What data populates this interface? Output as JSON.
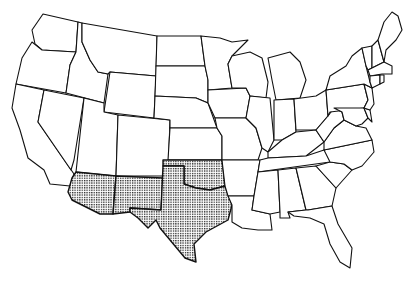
{
  "map": {
    "type": "outline map",
    "region": "Contiguous United States",
    "style": {
      "outline_color": "#111111",
      "fill_color": "#ffffff",
      "shade_pattern": "dot-grid stipple",
      "shade_color": "#222222"
    },
    "highlighted_states": [
      "Arizona",
      "New Mexico",
      "Texas",
      "Oklahoma"
    ],
    "states": [
      {
        "id": "WA",
        "name": "Washington",
        "shaded": false,
        "d": "M43,14 L78,22 L76,52 L42,50 L35,44 L32,30 Z"
      },
      {
        "id": "OR",
        "name": "Oregon",
        "shaded": false,
        "d": "M32,42 L42,50 L76,52 L70,65 L66,93 L16,84 L22,58 Z"
      },
      {
        "id": "CA",
        "name": "California",
        "shaded": false,
        "d": "M16,84 L44,90 L38,122 L74,174 L70,186 L50,184 L44,170 L28,158 L20,130 L12,108 Z"
      },
      {
        "id": "ID",
        "name": "Idaho",
        "shaded": false,
        "d": "M78,22 L82,23 L82,42 L90,60 L98,72 L108,74 L104,103 L66,93 L70,65 L76,52 Z"
      },
      {
        "id": "NV",
        "name": "Nevada",
        "shaded": false,
        "d": "M44,90 L84,98 L74,160 L71,170 L38,122 Z"
      },
      {
        "id": "MT",
        "name": "Montana",
        "shaded": false,
        "d": "M82,23 L157,36 L156,76 L110,72 L108,74 L98,72 L90,60 L82,42 Z"
      },
      {
        "id": "WY",
        "name": "Wyoming",
        "shaded": false,
        "d": "M110,72 L156,76 L154,118 L104,112 Z"
      },
      {
        "id": "UT",
        "name": "Utah",
        "shaded": false,
        "d": "M84,98 L104,103 L104,112 L118,115 L116,176 L76,172 Z"
      },
      {
        "id": "CO",
        "name": "Colorado",
        "shaded": false,
        "d": "M118,115 L170,120 L168,176 L116,176 Z"
      },
      {
        "id": "AZ",
        "name": "Arizona",
        "shaded": true,
        "d": "M76,172 L116,176 L113,214 L100,214 L72,200 L68,192 L72,178 Z"
      },
      {
        "id": "NM",
        "name": "New Mexico",
        "shaded": true,
        "d": "M116,176 L163,178 L161,210 L130,208 L130,212 L113,214 Z"
      },
      {
        "id": "ND",
        "name": "North Dakota",
        "shaded": false,
        "d": "M157,36 L201,36 L205,66 L156,66 Z"
      },
      {
        "id": "SD",
        "name": "South Dakota",
        "shaded": false,
        "d": "M156,66 L205,66 L208,80 L208,103 L196,98 L155,96 Z"
      },
      {
        "id": "NE",
        "name": "Nebraska",
        "shaded": false,
        "d": "M155,96 L196,98 L208,103 L217,128 L170,128 L170,120 L154,118 Z"
      },
      {
        "id": "KS",
        "name": "Kansas",
        "shaded": false,
        "d": "M170,128 L217,128 L222,136 L222,160 L168,160 Z"
      },
      {
        "id": "OK",
        "name": "Oklahoma",
        "shaded": true,
        "d": "M163,160 L222,160 L225,186 L210,190 L196,188 L184,184 L184,166 L163,166 Z"
      },
      {
        "id": "TX",
        "name": "Texas",
        "shaded": true,
        "d": "M163,166 L184,166 L184,184 L196,188 L210,190 L225,186 L232,205 L228,220 L206,232 L194,244 L196,262 L185,258 L170,240 L160,228 L156,220 L148,228 L138,218 L130,212 L130,208 L161,210 Z"
      },
      {
        "id": "MN",
        "name": "Minnesota",
        "shaded": false,
        "d": "M201,36 L220,38 L232,42 L248,40 L232,56 L228,64 L232,88 L208,90 L208,80 L205,66 Z"
      },
      {
        "id": "IA",
        "name": "Iowa",
        "shaded": false,
        "d": "M208,90 L246,88 L250,96 L246,118 L215,118 L208,103 Z"
      },
      {
        "id": "MO",
        "name": "Missouri",
        "shaded": false,
        "d": "M215,118 L246,118 L256,128 L262,148 L258,160 L222,160 L222,136 L217,128 Z"
      },
      {
        "id": "AR",
        "name": "Arkansas",
        "shaded": false,
        "d": "M222,160 L260,160 L258,172 L254,196 L228,196 L225,186 Z"
      },
      {
        "id": "LA",
        "name": "Louisiana",
        "shaded": false,
        "d": "M228,196 L254,196 L252,210 L270,214 L272,230 L258,230 L242,228 L232,222 L232,205 Z"
      },
      {
        "id": "WI",
        "name": "Wisconsin",
        "shaded": false,
        "d": "M232,56 L250,52 L262,58 L268,82 L266,98 L250,96 L246,88 L232,88 L228,64 Z"
      },
      {
        "id": "IL",
        "name": "Illinois",
        "shaded": false,
        "d": "M250,96 L270,98 L274,140 L268,152 L262,148 L256,128 L246,118 Z"
      },
      {
        "id": "MI",
        "name": "Michigan",
        "shaded": false,
        "d": "M268,58 L290,52 L300,62 L306,80 L300,98 L276,100 L272,80 Z"
      },
      {
        "id": "IN",
        "name": "Indiana",
        "shaded": false,
        "d": "M274,100 L294,99 L296,132 L282,140 L274,140 Z"
      },
      {
        "id": "OH",
        "name": "Ohio",
        "shaded": false,
        "d": "M294,99 L316,96 L326,90 L328,116 L316,130 L296,130 Z"
      },
      {
        "id": "KY",
        "name": "Kentucky",
        "shaded": false,
        "d": "M268,152 L282,140 L296,132 L316,130 L324,142 L306,156 L268,158 Z"
      },
      {
        "id": "TN",
        "name": "Tennessee",
        "shaded": false,
        "d": "M260,160 L268,158 L306,156 L324,150 L342,148 L330,162 L258,172 Z"
      },
      {
        "id": "MS",
        "name": "Mississippi",
        "shaded": false,
        "d": "M258,172 L278,170 L280,212 L270,214 L252,210 L254,196 Z"
      },
      {
        "id": "AL",
        "name": "Alabama",
        "shaded": false,
        "d": "M278,170 L296,168 L306,210 L288,212 L290,218 L280,218 L280,212 Z"
      },
      {
        "id": "GA",
        "name": "Georgia",
        "shaded": false,
        "d": "M296,168 L316,166 L336,188 L332,206 L308,210 L306,210 Z"
      },
      {
        "id": "FL",
        "name": "Florida",
        "shaded": false,
        "d": "M288,212 L306,210 L308,210 L332,206 L338,224 L352,248 L350,268 L340,262 L330,244 L324,224 L310,218 L294,216 Z"
      },
      {
        "id": "SC",
        "name": "South Carolina",
        "shaded": false,
        "d": "M316,166 L330,162 L344,164 L352,170 L336,188 Z"
      },
      {
        "id": "NC",
        "name": "North Carolina",
        "shaded": false,
        "d": "M324,150 L372,140 L374,152 L362,166 L352,170 L344,164 L330,162 Z"
      },
      {
        "id": "VA",
        "name": "Virginia",
        "shaded": false,
        "d": "M324,142 L334,128 L344,120 L356,126 L366,128 L372,140 L324,150 Z"
      },
      {
        "id": "WV",
        "name": "West Virginia",
        "shaded": false,
        "d": "M316,130 L328,116 L334,108 L342,112 L344,120 L334,128 L324,142 Z"
      },
      {
        "id": "PA",
        "name": "Pennsylvania",
        "shaded": false,
        "d": "M326,90 L364,84 L368,100 L364,108 L330,112 L328,116 Z"
      },
      {
        "id": "MD",
        "name": "Maryland",
        "shaded": false,
        "d": "M334,108 L364,108 L368,118 L362,124 L356,126 L344,120 L342,112 Z"
      },
      {
        "id": "DE",
        "name": "Delaware",
        "shaded": false,
        "d": "M364,108 L370,110 L372,122 L368,118 Z"
      },
      {
        "id": "NJ",
        "name": "New Jersey",
        "shaded": false,
        "d": "M364,84 L372,88 L374,104 L370,110 L364,108 L368,100 Z"
      },
      {
        "id": "NY",
        "name": "New York",
        "shaded": false,
        "d": "M326,90 L330,76 L346,66 L352,56 L362,48 L366,66 L370,82 L372,88 L364,84 Z"
      },
      {
        "id": "VT",
        "name": "Vermont",
        "shaded": false,
        "d": "M362,48 L372,46 L372,68 L368,70 L366,66 Z"
      },
      {
        "id": "NH",
        "name": "New Hampshire",
        "shaded": false,
        "d": "M372,46 L378,40 L384,62 L372,68 Z"
      },
      {
        "id": "ME",
        "name": "Maine",
        "shaded": false,
        "d": "M378,40 L384,22 L392,12 L398,16 L402,30 L396,40 L386,50 L384,62 Z"
      },
      {
        "id": "MA",
        "name": "Massachusetts",
        "shaded": false,
        "d": "M368,70 L384,62 L392,66 L392,74 L382,74 L370,76 Z"
      },
      {
        "id": "CT",
        "name": "Connecticut",
        "shaded": false,
        "d": "M370,76 L380,75 L380,84 L372,88 L370,82 Z"
      },
      {
        "id": "RI",
        "name": "Rhode Island",
        "shaded": false,
        "d": "M380,75 L384,75 L384,82 L380,84 Z"
      }
    ]
  }
}
